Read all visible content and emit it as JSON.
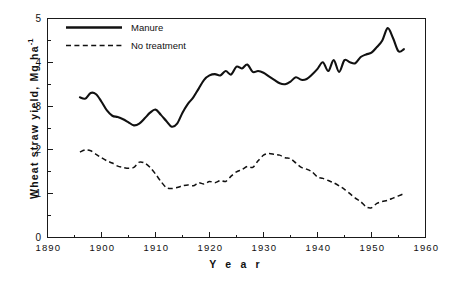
{
  "chart_data": {
    "type": "line",
    "title": "",
    "xlabel": "Y e a r",
    "ylabel": "Wheat  straw  yield,  Mg ha",
    "ylabel_sup": "-1",
    "xlim": [
      1890,
      1960
    ],
    "ylim": [
      0,
      5
    ],
    "xticks": [
      1890,
      1900,
      1910,
      1920,
      1930,
      1940,
      1950,
      1960
    ],
    "xtick_labels": [
      "1890",
      "1900",
      "1910",
      "1920",
      "1930",
      "1940",
      "1950",
      "1960"
    ],
    "yticks": [
      0,
      1,
      2,
      3,
      4,
      5
    ],
    "ytick_labels": [
      "0",
      "1",
      "2",
      "3",
      "4",
      "5"
    ],
    "x_minor_interval": 5,
    "y_minor_interval": 0.5,
    "grid": false,
    "legend_position": "upper-left-inside",
    "frame": "box",
    "line_color": "#111111",
    "series": [
      {
        "name": "Manure",
        "style": "solid",
        "x": [
          1896,
          1897,
          1898,
          1899,
          1900,
          1901,
          1902,
          1903,
          1904,
          1905,
          1906,
          1907,
          1908,
          1909,
          1910,
          1911,
          1912,
          1913,
          1914,
          1915,
          1916,
          1917,
          1918,
          1919,
          1920,
          1921,
          1922,
          1923,
          1924,
          1925,
          1926,
          1927,
          1928,
          1929,
          1930,
          1931,
          1932,
          1933,
          1934,
          1935,
          1936,
          1937,
          1938,
          1939,
          1940,
          1941,
          1942,
          1943,
          1944,
          1945,
          1946,
          1947,
          1948,
          1949,
          1950,
          1951,
          1952,
          1953,
          1954,
          1955,
          1956
        ],
        "values": [
          3.2,
          3.17,
          3.3,
          3.27,
          3.1,
          2.9,
          2.78,
          2.75,
          2.7,
          2.63,
          2.56,
          2.6,
          2.72,
          2.85,
          2.92,
          2.8,
          2.66,
          2.53,
          2.6,
          2.85,
          3.05,
          3.2,
          3.4,
          3.6,
          3.7,
          3.73,
          3.7,
          3.8,
          3.72,
          3.9,
          3.86,
          3.95,
          3.78,
          3.8,
          3.76,
          3.68,
          3.6,
          3.52,
          3.5,
          3.56,
          3.66,
          3.6,
          3.62,
          3.72,
          3.85,
          4.0,
          3.8,
          4.05,
          3.78,
          4.05,
          4.0,
          3.98,
          4.12,
          4.18,
          4.22,
          4.35,
          4.5,
          4.78,
          4.55,
          4.25,
          4.3
        ]
      },
      {
        "name": "No treatment",
        "style": "dashed",
        "x": [
          1896,
          1897,
          1898,
          1899,
          1900,
          1901,
          1902,
          1903,
          1904,
          1905,
          1906,
          1907,
          1908,
          1909,
          1910,
          1911,
          1912,
          1913,
          1914,
          1915,
          1916,
          1917,
          1918,
          1919,
          1920,
          1921,
          1922,
          1923,
          1924,
          1925,
          1926,
          1927,
          1928,
          1929,
          1930,
          1931,
          1932,
          1933,
          1934,
          1935,
          1936,
          1937,
          1938,
          1939,
          1940,
          1941,
          1942,
          1943,
          1944,
          1945,
          1946,
          1947,
          1948,
          1949,
          1950,
          1951,
          1952,
          1953,
          1954,
          1955,
          1956
        ],
        "values": [
          1.95,
          2.0,
          1.98,
          1.9,
          1.82,
          1.75,
          1.7,
          1.63,
          1.6,
          1.58,
          1.6,
          1.72,
          1.7,
          1.6,
          1.45,
          1.28,
          1.14,
          1.12,
          1.14,
          1.18,
          1.2,
          1.18,
          1.25,
          1.22,
          1.28,
          1.25,
          1.3,
          1.28,
          1.4,
          1.5,
          1.55,
          1.62,
          1.6,
          1.75,
          1.88,
          1.92,
          1.9,
          1.88,
          1.82,
          1.8,
          1.7,
          1.6,
          1.56,
          1.5,
          1.38,
          1.35,
          1.3,
          1.25,
          1.18,
          1.1,
          1.0,
          0.9,
          0.82,
          0.7,
          0.68,
          0.78,
          0.82,
          0.85,
          0.9,
          0.95,
          1.0
        ]
      }
    ],
    "legend": [
      {
        "label": "Manure",
        "style": "solid"
      },
      {
        "label": "No treatment",
        "style": "dashed"
      }
    ]
  }
}
